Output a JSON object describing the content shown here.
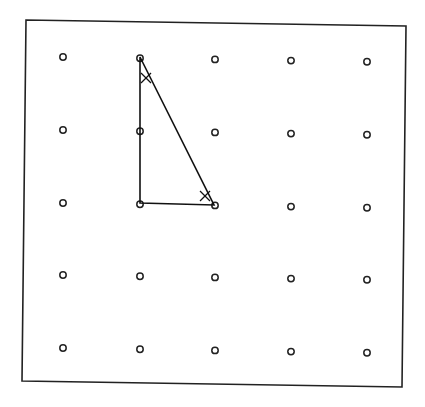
{
  "diagram": {
    "type": "geoboard-dot-grid",
    "grid": {
      "rows": 5,
      "cols": 5,
      "column_x": [
        63,
        140,
        215,
        291,
        367
      ],
      "row_y": [
        57,
        130,
        203,
        275,
        348
      ],
      "row_skew": [
        0,
        1,
        2,
        3,
        4
      ],
      "dot_radius": 3.2,
      "dot_color": "#222222"
    },
    "frame": {
      "points": [
        [
          26,
          20
        ],
        [
          406,
          26
        ],
        [
          402,
          387
        ],
        [
          22,
          381
        ]
      ],
      "stroke": "#222222"
    },
    "triangle": {
      "vertices": [
        [
          140,
          57
        ],
        [
          140,
          203
        ],
        [
          214,
          205
        ]
      ],
      "stroke": "#111111",
      "angle_marks": [
        {
          "vertex": "top",
          "at": [
            146,
            78
          ],
          "symbol": "×"
        },
        {
          "vertex": "bottom-right",
          "at": [
            205,
            196
          ],
          "symbol": "×"
        }
      ]
    }
  }
}
